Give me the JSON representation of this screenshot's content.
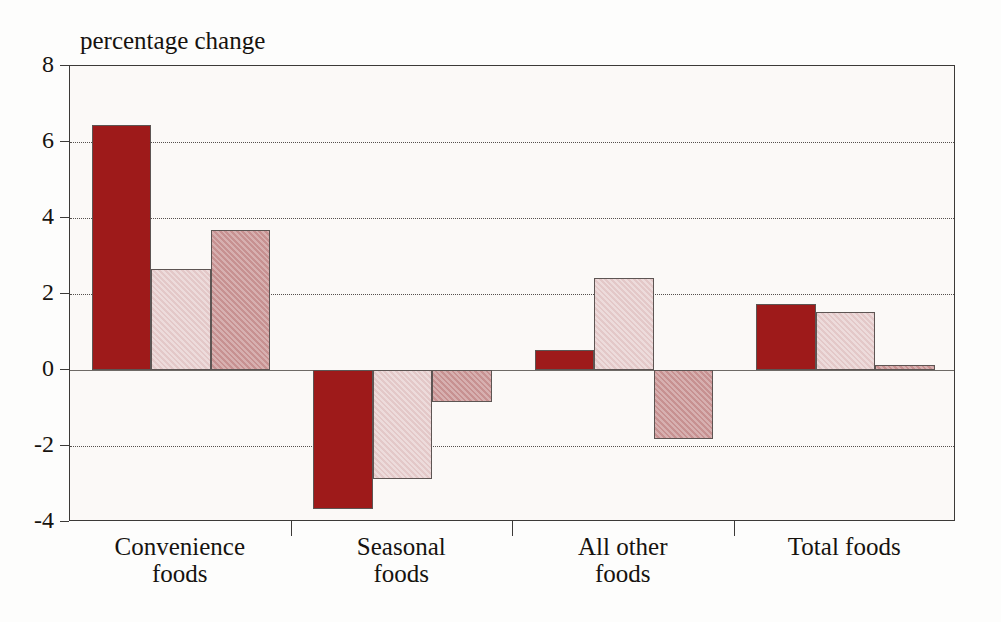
{
  "chart_data": {
    "type": "bar",
    "title": "",
    "axis_title": "percentage change",
    "xlabel": "",
    "ylabel": "percentage change",
    "categories": [
      "Convenience foods",
      "Seasonal foods",
      "All other foods",
      "Total foods"
    ],
    "category_lines": [
      [
        "Convenience",
        "foods"
      ],
      [
        "Seasonal",
        "foods"
      ],
      [
        "All other",
        "foods"
      ],
      [
        "Total foods",
        ""
      ]
    ],
    "series": [
      {
        "name": "series-1",
        "color": "#9e1a1a",
        "values": [
          6.45,
          -3.67,
          0.53,
          1.74
        ]
      },
      {
        "name": "series-2",
        "color": "#e3c8c8",
        "values": [
          2.66,
          -2.88,
          2.43,
          1.53
        ]
      },
      {
        "name": "series-3",
        "color": "#c79191",
        "values": [
          3.69,
          -0.85,
          -1.82,
          0.13
        ]
      }
    ],
    "ylim": [
      -4,
      8
    ],
    "yticks": [
      8,
      6,
      4,
      2,
      0,
      -2,
      -4
    ],
    "ytick_labels": [
      "8",
      "6",
      "4",
      "2",
      "0",
      "-2",
      "-4"
    ],
    "grid": true,
    "gridline_style": "dotted",
    "zero_line": 0,
    "legend": "none",
    "legend_position": "none",
    "colors": {
      "series_1": "#9e1a1a",
      "series_2": "#e3c8c8",
      "series_3": "#c79191",
      "axis": "#3c3a38",
      "plot_background": "#fbf9f7",
      "text": "#16130f"
    }
  }
}
